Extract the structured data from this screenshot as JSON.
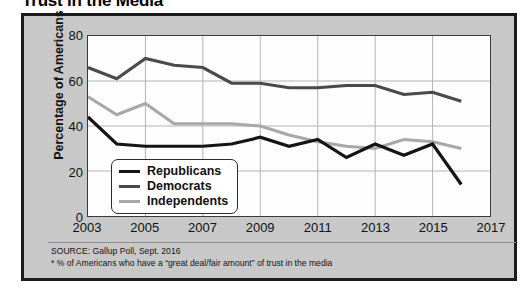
{
  "chart_data": {
    "type": "line",
    "title": "Trust in the Media",
    "xlabel": "",
    "ylabel": "Percentage of Americans",
    "xlim": [
      2003,
      2017
    ],
    "ylim": [
      0,
      80
    ],
    "ytick_labels": [
      "0",
      "20",
      "40",
      "60",
      "80"
    ],
    "ytick_values": [
      0,
      20,
      40,
      60,
      80
    ],
    "xtick_labels": [
      "2003",
      "2005",
      "2007",
      "2009",
      "2011",
      "2013",
      "2015",
      "2017"
    ],
    "xtick_values": [
      2003,
      2005,
      2007,
      2009,
      2011,
      2013,
      2015,
      2017
    ],
    "grid": true,
    "legend_position": "lower-left-inside",
    "x": [
      2003,
      2004,
      2005,
      2006,
      2007,
      2008,
      2009,
      2010,
      2011,
      2012,
      2013,
      2014,
      2015,
      2016
    ],
    "series": [
      {
        "name": "Republicans",
        "color": "#141414",
        "values": [
          44,
          32,
          31,
          31,
          31,
          32,
          35,
          31,
          34,
          26,
          32,
          27,
          32,
          14
        ]
      },
      {
        "name": "Democrats",
        "color": "#4a4a4a",
        "values": [
          66,
          61,
          70,
          67,
          66,
          59,
          59,
          57,
          57,
          58,
          58,
          54,
          55,
          51
        ]
      },
      {
        "name": "Independents",
        "color": "#a8a8a8",
        "values": [
          53,
          45,
          50,
          41,
          41,
          41,
          40,
          36,
          33,
          31,
          30,
          34,
          33,
          30
        ]
      }
    ],
    "source": "SOURCE: Gallup Poll, Sept. 2016",
    "footnote": "* % of Americans who have a “great deal/fair amount” of trust in the media"
  },
  "legend": {
    "items": [
      {
        "label": "Republicans"
      },
      {
        "label": "Democrats"
      },
      {
        "label": "Independents"
      }
    ]
  }
}
